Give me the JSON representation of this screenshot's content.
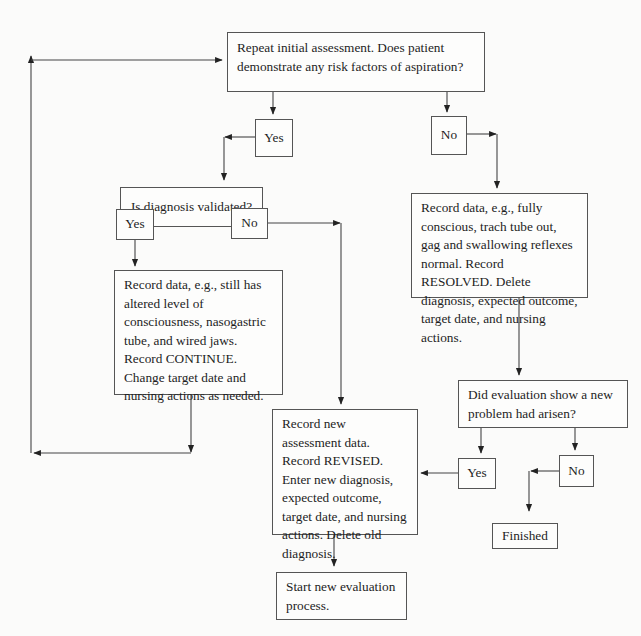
{
  "nodes": {
    "start_question": "Repeat initial assessment. Does patient demonstrate any risk factors of aspiration?",
    "yes_risk": "Yes",
    "no_risk": "No",
    "diagnosis_validated": "Is diagnosis validated?",
    "yes_validated": "Yes",
    "no_validated": "No",
    "continue_action": "Record data, e.g., still has altered level of consciousness, nasogastric tube, and wired jaws. Record CONTINUE. Change target date and nursing actions as needed.",
    "resolved_action": "Record data, e.g., fully conscious, trach tube out, gag and swallowing reflexes normal. Record RESOLVED. Delete diagnosis, expected outcome, target date, and nursing actions.",
    "new_problem_question": "Did evaluation show a new problem had arisen?",
    "yes_new_problem": "Yes",
    "no_new_problem": "No",
    "revised_action": "Record new assessment data. Record REVISED. Enter new diagnosis, expected outcome, target date, and nursing actions. Delete old diagnosis.",
    "finished": "Finished",
    "start_new": "Start new evaluation process."
  },
  "edges": [
    {
      "from": "start_question",
      "to": "yes_risk"
    },
    {
      "from": "start_question",
      "to": "no_risk"
    },
    {
      "from": "yes_risk",
      "to": "diagnosis_validated"
    },
    {
      "from": "no_risk",
      "to": "resolved_action"
    },
    {
      "from": "diagnosis_validated",
      "to": "yes_validated"
    },
    {
      "from": "diagnosis_validated",
      "to": "no_validated"
    },
    {
      "from": "yes_validated",
      "to": "continue_action"
    },
    {
      "from": "no_validated",
      "to": "revised_action"
    },
    {
      "from": "continue_action",
      "to": "start_question"
    },
    {
      "from": "resolved_action",
      "to": "new_problem_question"
    },
    {
      "from": "new_problem_question",
      "to": "yes_new_problem"
    },
    {
      "from": "new_problem_question",
      "to": "no_new_problem"
    },
    {
      "from": "yes_new_problem",
      "to": "revised_action"
    },
    {
      "from": "no_new_problem",
      "to": "finished"
    },
    {
      "from": "revised_action",
      "to": "start_new"
    }
  ],
  "colors": {
    "line": "#333333",
    "border": "#555555",
    "background": "#fbfbfa"
  }
}
